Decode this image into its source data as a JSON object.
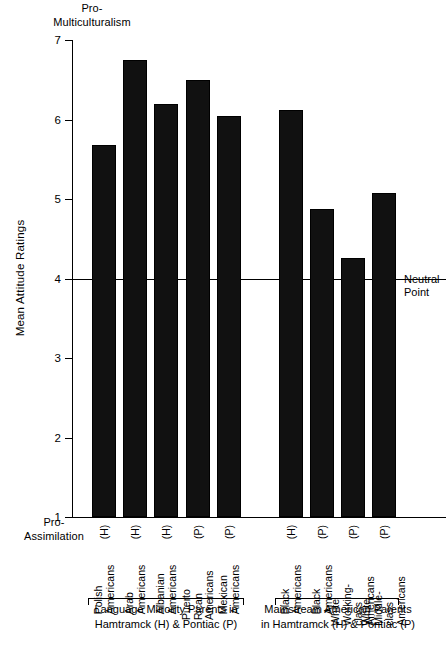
{
  "chart_data": {
    "type": "bar",
    "title": "",
    "xlabel": "",
    "ylabel": "Mean Attitude Ratings",
    "ylim": [
      1,
      7
    ],
    "yticks": [
      7,
      6,
      5,
      4,
      3,
      2,
      1
    ],
    "grid": false,
    "legend": "none",
    "axis_poles": {
      "top": "Pro-\nMulticulturalism",
      "bottom": "Pro-\nAssimilation"
    },
    "annotations": [
      {
        "label": "Neutral\nPoint",
        "y": 4,
        "type": "reference-line"
      }
    ],
    "categories": [
      "Polish Americans (H)",
      "Arab Americans (H)",
      "Albanian Americans (H)",
      "Puerto Rican Americans (P)",
      "Mexican Americans (P)",
      "Black Americans (H)",
      "Black Americans (P)",
      "White Working-class Americans (P)",
      "White Middle-class Americans (P)"
    ],
    "values": [
      5.68,
      6.75,
      6.2,
      6.5,
      6.05,
      6.12,
      4.87,
      4.26,
      5.08
    ],
    "bars": [
      {
        "name": "Polish\nAmericans",
        "site": "(H)",
        "value": 5.68,
        "group": 0
      },
      {
        "name": "Arab\nAmericans",
        "site": "(H)",
        "value": 6.75,
        "group": 0
      },
      {
        "name": "Albanian\nAmericans",
        "site": "(H)",
        "value": 6.2,
        "group": 0
      },
      {
        "name": "Puerto Rican\nAmericans",
        "site": "(P)",
        "value": 6.5,
        "group": 0
      },
      {
        "name": "Mexican\nAmericans",
        "site": "(P)",
        "value": 6.05,
        "group": 0
      },
      {
        "name": "Black\nAmericans",
        "site": "(H)",
        "value": 6.12,
        "group": 1
      },
      {
        "name": "Black\nAmericans",
        "site": "(P)",
        "value": 4.87,
        "group": 1
      },
      {
        "name": "White\nWorking-class\nAmericans",
        "site": "(P)",
        "value": 4.26,
        "group": 1
      },
      {
        "name": "White\nMiddle-class\nAmericans",
        "site": "(P)",
        "value": 5.08,
        "group": 1
      }
    ],
    "groups": [
      {
        "caption": "Language Minority Parents in\nHamtramck (H) & Pontiac (P)"
      },
      {
        "caption": "Mainstream American Parents\nin Hamtramck (H) & Pontiac (P)"
      }
    ],
    "colors": {
      "bar_fill": "#111111",
      "axis": "#000000",
      "background": "#ffffff"
    }
  }
}
